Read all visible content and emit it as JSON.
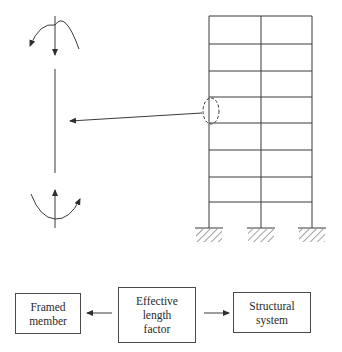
{
  "figure": {
    "type": "structural-diagram"
  },
  "frame": {
    "stories": 8,
    "bays": 2,
    "column_x": [
      209,
      261,
      312
    ],
    "floor_y": [
      16,
      44,
      71,
      97,
      123,
      150,
      177,
      202,
      228
    ],
    "supports": [
      "fixed",
      "fixed",
      "fixed"
    ],
    "highlighted_member": "left column, 4th story from top"
  },
  "isolated_member": {
    "top_moment": "curved arrow, counterclockwise",
    "top_axial": "downward arrow",
    "bottom_moment": "curved arrow, counterclockwise",
    "bottom_axial": "upward arrow"
  },
  "flowchart": {
    "boxes": [
      {
        "id": "framed",
        "lines": [
          "Framed",
          "member"
        ]
      },
      {
        "id": "effective",
        "lines": [
          "Effective",
          "length",
          "factor"
        ]
      },
      {
        "id": "structural",
        "lines": [
          "Structural",
          "system"
        ]
      }
    ],
    "arrows": [
      {
        "from": "effective",
        "to": "framed"
      },
      {
        "from": "effective",
        "to": "structural"
      }
    ]
  },
  "colors": {
    "line": "#3a3a3a",
    "background": "#ffffff"
  }
}
